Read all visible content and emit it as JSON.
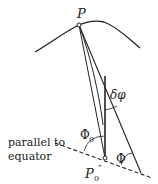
{
  "diagram": {
    "labels": {
      "point_p": "P",
      "point_p0": "P",
      "point_p0_sub": "0",
      "point_p0_prime": "″",
      "delta_phi": "δφ",
      "phi0": "Φ",
      "phi0_sub": "0",
      "phi": "Φ",
      "parallel_line1": "parallel to",
      "parallel_line2": "equator"
    },
    "colors": {
      "stroke": "#222222",
      "background": "#ffffff"
    }
  }
}
